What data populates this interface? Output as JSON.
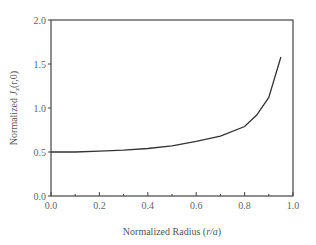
{
  "chart_data": {
    "type": "line",
    "title": "",
    "xlabel": "Normalized Radius (r/a)",
    "xlabel_plain": "Normalized Radius (",
    "xlabel_italic": "r/a",
    "xlabel_close": ")",
    "ylabel": "Normalized J_z(r,0)",
    "ylabel_plain": "Normalized ",
    "ylabel_italic": "J",
    "ylabel_sub": "z",
    "ylabel_args": "(r,0)",
    "xlim": [
      0.0,
      1.0
    ],
    "ylim": [
      0.0,
      2.0
    ],
    "x_ticks": [
      "0.0",
      "0.2",
      "0.4",
      "0.6",
      "0.8",
      "1.0"
    ],
    "y_ticks": [
      "0.0",
      "0.5",
      "1.0",
      "1.5",
      "2.0"
    ],
    "grid": false,
    "legend": null,
    "series": [
      {
        "name": "Normalized Jz",
        "x": [
          0.0,
          0.1,
          0.2,
          0.3,
          0.4,
          0.5,
          0.6,
          0.7,
          0.8,
          0.85,
          0.9,
          0.95
        ],
        "values": [
          0.5,
          0.5,
          0.51,
          0.52,
          0.54,
          0.57,
          0.62,
          0.68,
          0.79,
          0.92,
          1.12,
          1.58
        ]
      }
    ]
  }
}
